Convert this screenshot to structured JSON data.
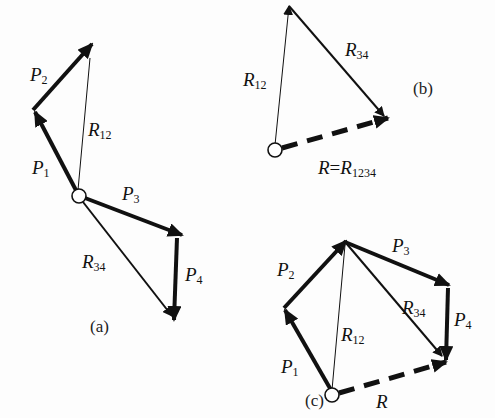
{
  "figure": {
    "panels": [
      {
        "id": "a",
        "caption": "(a)"
      },
      {
        "id": "b",
        "caption": "(b)"
      },
      {
        "id": "c",
        "caption": "(c)"
      }
    ]
  },
  "labels": {
    "a": {
      "P1": {
        "sym": "P",
        "sub": "1"
      },
      "P2": {
        "sym": "P",
        "sub": "2"
      },
      "P3": {
        "sym": "P",
        "sub": "3"
      },
      "P4": {
        "sym": "P",
        "sub": "4"
      },
      "R12": {
        "sym": "R",
        "sub": "12"
      },
      "R34": {
        "sym": "R",
        "sub": "34"
      }
    },
    "b": {
      "R12": {
        "sym": "R",
        "sub": "12"
      },
      "R34": {
        "sym": "R",
        "sub": "34"
      },
      "R": {
        "sym": "R",
        "eq": "=",
        "sym2": "R",
        "sub": "1234"
      }
    },
    "c": {
      "P1": {
        "sym": "P",
        "sub": "1"
      },
      "P2": {
        "sym": "P",
        "sub": "2"
      },
      "P3": {
        "sym": "P",
        "sub": "3"
      },
      "P4": {
        "sym": "P",
        "sub": "4"
      },
      "R12": {
        "sym": "R",
        "sub": "12"
      },
      "R34": {
        "sym": "R",
        "sub": "34"
      },
      "R": {
        "sym": "R"
      }
    }
  },
  "colors": {
    "ink": "#111111",
    "background": "#fdfdfd"
  }
}
